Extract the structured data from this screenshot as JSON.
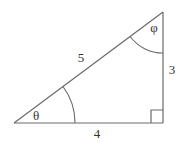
{
  "diagram": {
    "type": "right-triangle",
    "vertices": {
      "A": {
        "x": 14,
        "y": 123
      },
      "B": {
        "x": 163,
        "y": 123
      },
      "C": {
        "x": 163,
        "y": 12
      }
    },
    "sides": {
      "hypotenuse": {
        "label": "5",
        "pos": {
          "x": 81,
          "y": 62
        }
      },
      "base": {
        "label": "4",
        "pos": {
          "x": 97,
          "y": 138
        }
      },
      "height": {
        "label": "3",
        "pos": {
          "x": 172,
          "y": 74
        }
      }
    },
    "angles": {
      "theta": {
        "label": "θ",
        "pos": {
          "x": 36,
          "y": 120
        }
      },
      "phi": {
        "label": "φ",
        "pos": {
          "x": 154,
          "y": 32
        }
      }
    },
    "right_angle_marker": true,
    "line_color": "#6a6a6a"
  }
}
